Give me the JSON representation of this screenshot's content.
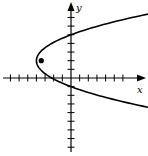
{
  "chart_data": {
    "type": "line",
    "title": "",
    "xlabel": "x",
    "ylabel": "y",
    "grid": false,
    "xlim": [
      -7,
      8
    ],
    "ylim": [
      -9,
      8
    ],
    "x_ticks_left": 7,
    "x_ticks_right": 6,
    "y_ticks_up": 7,
    "y_ticks_down": 8,
    "series": [
      {
        "name": "parabola",
        "equation": "(y-2)^2 = 9(x+4)/4",
        "vertex": [
          -4,
          2
        ],
        "y_intercepts": [
          5,
          -1
        ],
        "opens": "right"
      }
    ],
    "points": [
      {
        "name": "focus",
        "x": -3.44,
        "y": 2,
        "marker": "filled-circle"
      }
    ]
  },
  "axes": {
    "x_label": "x",
    "y_label": "y"
  }
}
